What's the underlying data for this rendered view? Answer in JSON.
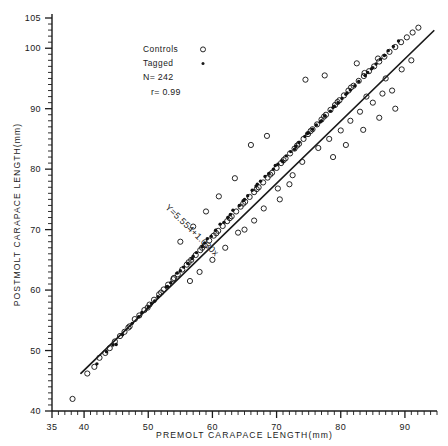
{
  "figure": {
    "name": "premolt-postmolt-carapace-scatter",
    "background": "#ffffff",
    "ink": "#1a1a1a"
  },
  "annotations": {
    "equation": "Y=5.554+1.030x",
    "legend_title_controls": "Controls",
    "legend_title_tagged": "Tagged",
    "sample_size": "N= 242",
    "correlation": "r= 0.99"
  },
  "chart_data": {
    "type": "scatter",
    "title": "",
    "xlabel": "PREMOLT CARAPACE LENGTH(mm)",
    "ylabel": "POSTMOLT CARAPACE LENGTH(mm)",
    "xlim": [
      35,
      95
    ],
    "ylim": [
      40,
      105
    ],
    "xticks": [
      35,
      40,
      50,
      60,
      70,
      80,
      90
    ],
    "xtick_labels": [
      "35",
      "40",
      "50",
      "60",
      "70",
      "80",
      "90"
    ],
    "yticks": [
      40,
      50,
      60,
      70,
      80,
      90,
      100,
      105
    ],
    "ytick_labels": [
      "40",
      "50",
      "60",
      "70",
      "80",
      "90",
      "100",
      "105"
    ],
    "xminor_step": 1,
    "yminor_step": 1,
    "grid": false,
    "legend_position": "upper-left-inset",
    "n": 242,
    "r": 0.99,
    "fit": {
      "label": "Y=5.554+1.030x",
      "intercept": 5.554,
      "slope": 1.03,
      "x_start": 39.5,
      "x_end": 94.5
    },
    "series": [
      {
        "name": "Controls",
        "marker": "open-circle",
        "color": "#1a1a1a",
        "points": [
          [
            38.2,
            42.0
          ],
          [
            40.5,
            46.2
          ],
          [
            41.6,
            47.3
          ],
          [
            42.4,
            48.8
          ],
          [
            43.3,
            49.6
          ],
          [
            44.8,
            51.5
          ],
          [
            45.6,
            52.4
          ],
          [
            46.3,
            53.1
          ],
          [
            47.1,
            54.0
          ],
          [
            47.9,
            55.2
          ],
          [
            48.6,
            55.8
          ],
          [
            49.4,
            56.7
          ],
          [
            50.2,
            57.6
          ],
          [
            50.9,
            58.4
          ],
          [
            51.7,
            59.3
          ],
          [
            52.4,
            60.1
          ],
          [
            53.1,
            60.9
          ],
          [
            53.9,
            61.8
          ],
          [
            54.6,
            62.6
          ],
          [
            55.3,
            63.4
          ],
          [
            56.0,
            64.2
          ],
          [
            56.7,
            65.0
          ],
          [
            57.4,
            65.8
          ],
          [
            58.1,
            66.6
          ],
          [
            58.8,
            67.4
          ],
          [
            59.5,
            68.2
          ],
          [
            60.2,
            69.0
          ],
          [
            60.9,
            69.8
          ],
          [
            61.6,
            70.6
          ],
          [
            62.3,
            71.4
          ],
          [
            63.0,
            72.2
          ],
          [
            63.7,
            73.0
          ],
          [
            64.4,
            73.8
          ],
          [
            65.1,
            74.6
          ],
          [
            65.8,
            75.4
          ],
          [
            66.5,
            76.2
          ],
          [
            67.2,
            77.0
          ],
          [
            67.9,
            77.8
          ],
          [
            68.6,
            78.6
          ],
          [
            69.3,
            79.4
          ],
          [
            70.0,
            80.2
          ],
          [
            70.7,
            81.0
          ],
          [
            71.4,
            81.8
          ],
          [
            72.1,
            82.6
          ],
          [
            72.8,
            83.4
          ],
          [
            73.5,
            84.2
          ],
          [
            74.2,
            85.0
          ],
          [
            74.9,
            85.8
          ],
          [
            75.6,
            86.6
          ],
          [
            76.3,
            87.4
          ],
          [
            77.0,
            88.2
          ],
          [
            77.7,
            89.0
          ],
          [
            78.4,
            89.8
          ],
          [
            79.1,
            90.6
          ],
          [
            79.8,
            91.4
          ],
          [
            80.5,
            92.2
          ],
          [
            81.2,
            93.0
          ],
          [
            82.0,
            93.8
          ],
          [
            82.8,
            94.6
          ],
          [
            83.6,
            95.4
          ],
          [
            84.4,
            96.2
          ],
          [
            85.2,
            97.0
          ],
          [
            86.0,
            97.8
          ],
          [
            86.8,
            98.6
          ],
          [
            87.6,
            99.4
          ],
          [
            88.5,
            100.2
          ],
          [
            89.4,
            101.0
          ],
          [
            90.3,
            101.8
          ],
          [
            91.2,
            102.6
          ],
          [
            92.1,
            103.4
          ],
          [
            44.0,
            50.4
          ],
          [
            46.9,
            53.8
          ],
          [
            49.9,
            57.1
          ],
          [
            52.0,
            59.6
          ],
          [
            54.0,
            62.0
          ],
          [
            56.3,
            64.6
          ],
          [
            58.4,
            67.0
          ],
          [
            60.6,
            69.4
          ],
          [
            62.7,
            71.9
          ],
          [
            64.8,
            74.3
          ],
          [
            66.9,
            76.7
          ],
          [
            69.0,
            79.1
          ],
          [
            71.1,
            81.5
          ],
          [
            73.2,
            83.9
          ],
          [
            75.3,
            86.3
          ],
          [
            77.4,
            88.7
          ],
          [
            79.5,
            91.1
          ],
          [
            81.6,
            93.5
          ],
          [
            83.7,
            95.9
          ],
          [
            85.8,
            98.3
          ],
          [
            70.2,
            76.8
          ],
          [
            72.5,
            79.0
          ],
          [
            74.0,
            81.2
          ],
          [
            76.5,
            83.5
          ],
          [
            78.2,
            85.0
          ],
          [
            80.0,
            86.4
          ],
          [
            81.5,
            88.0
          ],
          [
            83.0,
            89.5
          ],
          [
            85.0,
            91.0
          ],
          [
            86.5,
            92.5
          ],
          [
            74.5,
            94.8
          ],
          [
            77.5,
            95.5
          ],
          [
            82.5,
            97.5
          ],
          [
            84.0,
            92.0
          ],
          [
            87.0,
            95.0
          ],
          [
            88.0,
            93.0
          ],
          [
            89.5,
            96.5
          ],
          [
            91.0,
            98.0
          ],
          [
            66.0,
            84.0
          ],
          [
            68.5,
            85.5
          ],
          [
            63.5,
            78.5
          ],
          [
            61.0,
            75.5
          ],
          [
            59.0,
            73.0
          ],
          [
            57.0,
            70.5
          ],
          [
            55.0,
            68.0
          ],
          [
            86.0,
            88.5
          ],
          [
            88.5,
            90.0
          ],
          [
            83.5,
            86.5
          ],
          [
            80.8,
            84.0
          ],
          [
            78.8,
            82.0
          ],
          [
            64.0,
            69.5
          ],
          [
            62.0,
            67.0
          ],
          [
            60.0,
            65.0
          ],
          [
            58.0,
            63.0
          ],
          [
            56.5,
            61.5
          ],
          [
            68.0,
            73.5
          ],
          [
            70.5,
            75.0
          ],
          [
            72.0,
            77.5
          ],
          [
            66.5,
            71.5
          ],
          [
            65.0,
            70.0
          ]
        ]
      },
      {
        "name": "Tagged",
        "marker": "filled-dot",
        "color": "#111111",
        "points": [
          [
            42.0,
            47.8
          ],
          [
            45.0,
            51.0
          ],
          [
            47.5,
            54.5
          ],
          [
            50.0,
            57.2
          ],
          [
            51.5,
            58.9
          ],
          [
            53.5,
            61.2
          ],
          [
            55.5,
            63.8
          ],
          [
            57.5,
            66.2
          ],
          [
            59.2,
            68.5
          ],
          [
            61.2,
            70.9
          ],
          [
            62.8,
            72.5
          ],
          [
            64.2,
            74.0
          ],
          [
            65.5,
            75.6
          ],
          [
            66.8,
            77.2
          ],
          [
            68.2,
            78.8
          ],
          [
            69.5,
            80.0
          ],
          [
            70.8,
            81.4
          ],
          [
            72.2,
            82.9
          ],
          [
            73.5,
            84.4
          ],
          [
            74.8,
            85.9
          ],
          [
            76.2,
            87.3
          ],
          [
            77.5,
            88.8
          ],
          [
            78.8,
            90.2
          ],
          [
            80.2,
            91.7
          ],
          [
            81.5,
            93.1
          ],
          [
            82.8,
            94.5
          ],
          [
            84.2,
            96.0
          ],
          [
            85.5,
            97.4
          ],
          [
            86.8,
            98.8
          ],
          [
            88.2,
            100.3
          ],
          [
            43.5,
            49.8
          ],
          [
            46.0,
            52.6
          ],
          [
            48.5,
            55.6
          ],
          [
            52.8,
            60.5
          ],
          [
            54.5,
            62.8
          ],
          [
            56.8,
            65.2
          ],
          [
            58.8,
            67.8
          ],
          [
            60.5,
            69.9
          ],
          [
            63.2,
            73.2
          ],
          [
            65.0,
            75.0
          ],
          [
            67.5,
            78.0
          ],
          [
            69.8,
            80.6
          ],
          [
            71.5,
            82.2
          ],
          [
            73.0,
            83.8
          ],
          [
            75.0,
            86.0
          ],
          [
            76.8,
            87.8
          ],
          [
            79.0,
            90.4
          ],
          [
            80.8,
            92.4
          ],
          [
            82.2,
            93.8
          ],
          [
            83.8,
            95.5
          ],
          [
            44.5,
            50.9
          ],
          [
            49.0,
            56.3
          ],
          [
            51.0,
            58.2
          ],
          [
            55.0,
            63.2
          ],
          [
            57.0,
            65.6
          ],
          [
            59.8,
            68.9
          ],
          [
            61.8,
            71.2
          ],
          [
            64.8,
            74.8
          ],
          [
            66.2,
            76.5
          ],
          [
            68.8,
            79.3
          ],
          [
            70.2,
            80.8
          ],
          [
            72.8,
            83.3
          ],
          [
            74.4,
            85.4
          ],
          [
            77.0,
            88.0
          ],
          [
            78.4,
            89.6
          ],
          [
            81.0,
            92.6
          ],
          [
            84.8,
            96.6
          ],
          [
            86.2,
            98.2
          ],
          [
            87.4,
            99.6
          ],
          [
            89.0,
            101.2
          ],
          [
            50.5,
            57.8
          ],
          [
            53.0,
            60.6
          ],
          [
            56.2,
            64.4
          ],
          [
            58.4,
            67.2
          ],
          [
            62.4,
            72.0
          ],
          [
            67.0,
            77.5
          ],
          [
            71.0,
            81.2
          ],
          [
            75.6,
            86.6
          ],
          [
            79.6,
            91.0
          ],
          [
            85.0,
            96.8
          ]
        ]
      }
    ]
  }
}
